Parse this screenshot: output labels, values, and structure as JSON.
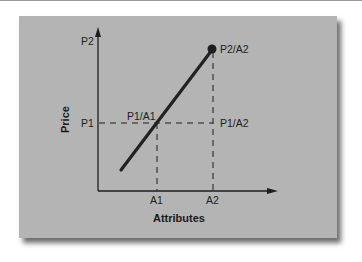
{
  "diagram": {
    "axes": {
      "x_title": "Attributes",
      "y_title": "Price"
    },
    "ticks": {
      "y": [
        "P2",
        "P1"
      ],
      "x": [
        "A1",
        "A2"
      ]
    },
    "points": {
      "p1a1": "P1/A1",
      "p1a2": "P1/A2",
      "p2a2": "P2/A2"
    },
    "colors": {
      "panel": "#b4b4b4",
      "ink": "#1e1e1e",
      "shadow": "#3c3c3c"
    }
  }
}
